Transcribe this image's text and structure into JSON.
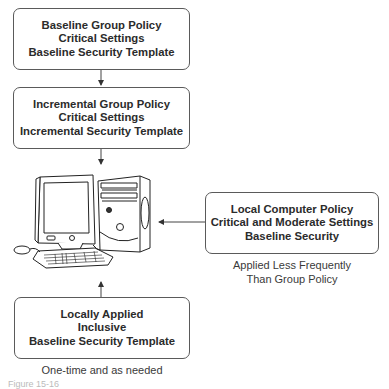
{
  "diagram": {
    "boxes": [
      {
        "id": "baseline-group-policy",
        "lines": [
          "Baseline Group Policy",
          "Critical Settings",
          "Baseline Security Template"
        ]
      },
      {
        "id": "incremental-group-policy",
        "lines": [
          "Incremental Group Policy",
          "Critical Settings",
          "Incremental Security Template"
        ]
      },
      {
        "id": "local-computer-policy",
        "lines": [
          "Local Computer Policy",
          "Critical and Moderate Settings",
          "Baseline Security"
        ]
      },
      {
        "id": "locally-applied",
        "lines": [
          "Locally Applied",
          "Inclusive",
          "Baseline Security Template"
        ]
      }
    ],
    "captions": {
      "local_computer_policy": [
        "Applied Less Frequently",
        "Than Group Policy"
      ],
      "locally_applied": "One-time and as needed"
    },
    "center_node": {
      "icon": "desktop-computer-icon",
      "label": ""
    },
    "arrows": [
      {
        "from": "baseline-group-policy",
        "to": "incremental-group-policy"
      },
      {
        "from": "incremental-group-policy",
        "to": "computer"
      },
      {
        "from": "local-computer-policy",
        "to": "computer"
      },
      {
        "from": "locally-applied",
        "to": "computer"
      }
    ],
    "figure_label": "Figure 15-16"
  }
}
